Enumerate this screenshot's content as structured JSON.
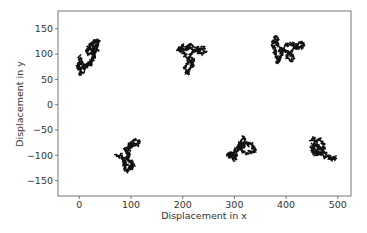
{
  "chart_data": {
    "type": "line",
    "title": "",
    "xlabel": "Displacement in x",
    "ylabel": "Displacement in y",
    "xlim": [
      -40,
      525
    ],
    "ylim": [
      -180,
      185
    ],
    "xticks": [
      0,
      100,
      200,
      300,
      400,
      500
    ],
    "yticks": [
      -150,
      -100,
      -50,
      0,
      50,
      100,
      150
    ],
    "grid": false,
    "legend": null,
    "line_color": "#111111",
    "series": [
      {
        "name": "walk-1",
        "center": [
          18,
          95
        ],
        "extent_x": [
          -5,
          40
        ],
        "extent_y": [
          57,
          130
        ],
        "path": [
          [
            0,
            80
          ],
          [
            -4,
            75
          ],
          [
            2,
            68
          ],
          [
            0,
            60
          ],
          [
            6,
            64
          ],
          [
            10,
            72
          ],
          [
            4,
            82
          ],
          [
            -2,
            78
          ],
          [
            3,
            86
          ],
          [
            8,
            80
          ],
          [
            14,
            76
          ],
          [
            18,
            82
          ],
          [
            22,
            78
          ],
          [
            20,
            86
          ],
          [
            26,
            92
          ],
          [
            30,
            98
          ],
          [
            24,
            104
          ],
          [
            18,
            100
          ],
          [
            14,
            108
          ],
          [
            20,
            114
          ],
          [
            28,
            110
          ],
          [
            24,
            118
          ],
          [
            30,
            124
          ],
          [
            36,
            128
          ],
          [
            38,
            120
          ],
          [
            32,
            114
          ],
          [
            36,
            108
          ],
          [
            30,
            104
          ],
          [
            26,
            112
          ],
          [
            34,
            118
          ],
          [
            28,
            126
          ],
          [
            22,
            120
          ],
          [
            16,
            114
          ],
          [
            24,
            106
          ],
          [
            30,
            96
          ],
          [
            26,
            90
          ],
          [
            20,
            84
          ],
          [
            12,
            78
          ],
          [
            6,
            74
          ],
          [
            0,
            70
          ],
          [
            -4,
            78
          ],
          [
            2,
            90
          ],
          [
            0,
            96
          ]
        ]
      },
      {
        "name": "walk-2",
        "center": [
          215,
          95
        ],
        "extent_x": [
          190,
          245
        ],
        "extent_y": [
          60,
          122
        ],
        "path": [
          [
            190,
            110
          ],
          [
            196,
            106
          ],
          [
            200,
            112
          ],
          [
            206,
            108
          ],
          [
            212,
            116
          ],
          [
            216,
            110
          ],
          [
            222,
            106
          ],
          [
            228,
            112
          ],
          [
            234,
            108
          ],
          [
            240,
            114
          ],
          [
            244,
            106
          ],
          [
            238,
            100
          ],
          [
            232,
            104
          ],
          [
            226,
            108
          ],
          [
            218,
            102
          ],
          [
            214,
            96
          ],
          [
            220,
            90
          ],
          [
            218,
            82
          ],
          [
            212,
            86
          ],
          [
            208,
            80
          ],
          [
            204,
            72
          ],
          [
            206,
            64
          ],
          [
            210,
            60
          ],
          [
            212,
            68
          ],
          [
            216,
            74
          ],
          [
            220,
            80
          ],
          [
            214,
            88
          ],
          [
            208,
            94
          ],
          [
            204,
            100
          ],
          [
            198,
            104
          ],
          [
            194,
            112
          ],
          [
            200,
            118
          ],
          [
            208,
            114
          ],
          [
            216,
            120
          ],
          [
            222,
            114
          ]
        ]
      },
      {
        "name": "walk-3",
        "center": [
          395,
          110
        ],
        "extent_x": [
          370,
          435
        ],
        "extent_y": [
          82,
          135
        ],
        "path": [
          [
            372,
            120
          ],
          [
            376,
            128
          ],
          [
            380,
            134
          ],
          [
            384,
            126
          ],
          [
            378,
            118
          ],
          [
            374,
            110
          ],
          [
            378,
            102
          ],
          [
            382,
            94
          ],
          [
            386,
            88
          ],
          [
            382,
            84
          ],
          [
            388,
            92
          ],
          [
            392,
            100
          ],
          [
            388,
            108
          ],
          [
            394,
            114
          ],
          [
            400,
            120
          ],
          [
            406,
            118
          ],
          [
            412,
            122
          ],
          [
            418,
            116
          ],
          [
            424,
            120
          ],
          [
            430,
            124
          ],
          [
            434,
            116
          ],
          [
            428,
            112
          ],
          [
            420,
            114
          ],
          [
            412,
            108
          ],
          [
            406,
            100
          ],
          [
            400,
            96
          ],
          [
            404,
            90
          ],
          [
            410,
            86
          ],
          [
            414,
            92
          ],
          [
            410,
            98
          ],
          [
            404,
            104
          ],
          [
            396,
            106
          ],
          [
            390,
            112
          ],
          [
            384,
            118
          ],
          [
            378,
            124
          ],
          [
            374,
            116
          ],
          [
            380,
            108
          ]
        ]
      },
      {
        "name": "walk-4",
        "center": [
          95,
          -110
        ],
        "extent_x": [
          70,
          118
        ],
        "extent_y": [
          -132,
          -68
        ],
        "path": [
          [
            70,
            -100
          ],
          [
            76,
            -104
          ],
          [
            80,
            -98
          ],
          [
            84,
            -106
          ],
          [
            88,
            -112
          ],
          [
            86,
            -120
          ],
          [
            90,
            -128
          ],
          [
            94,
            -132
          ],
          [
            98,
            -124
          ],
          [
            104,
            -120
          ],
          [
            100,
            -114
          ],
          [
            94,
            -108
          ],
          [
            98,
            -100
          ],
          [
            92,
            -94
          ],
          [
            88,
            -88
          ],
          [
            94,
            -84
          ],
          [
            98,
            -78
          ],
          [
            104,
            -74
          ],
          [
            110,
            -70
          ],
          [
            116,
            -74
          ],
          [
            112,
            -80
          ],
          [
            106,
            -78
          ],
          [
            100,
            -84
          ],
          [
            96,
            -92
          ],
          [
            92,
            -100
          ],
          [
            86,
            -110
          ],
          [
            92,
            -118
          ],
          [
            100,
            -126
          ],
          [
            106,
            -118
          ],
          [
            98,
            -112
          ],
          [
            90,
            -104
          ]
        ]
      },
      {
        "name": "walk-5",
        "center": [
          315,
          -88
        ],
        "extent_x": [
          285,
          345
        ],
        "extent_y": [
          -110,
          -63
        ],
        "path": [
          [
            286,
            -96
          ],
          [
            290,
            -100
          ],
          [
            294,
            -94
          ],
          [
            298,
            -104
          ],
          [
            300,
            -110
          ],
          [
            304,
            -102
          ],
          [
            300,
            -96
          ],
          [
            306,
            -90
          ],
          [
            310,
            -84
          ],
          [
            308,
            -76
          ],
          [
            314,
            -70
          ],
          [
            318,
            -64
          ],
          [
            322,
            -72
          ],
          [
            326,
            -80
          ],
          [
            332,
            -76
          ],
          [
            336,
            -84
          ],
          [
            340,
            -90
          ],
          [
            334,
            -96
          ],
          [
            328,
            -92
          ],
          [
            322,
            -98
          ],
          [
            316,
            -92
          ],
          [
            312,
            -86
          ],
          [
            318,
            -80
          ],
          [
            314,
            -74
          ],
          [
            308,
            -82
          ],
          [
            302,
            -90
          ],
          [
            296,
            -98
          ],
          [
            292,
            -104
          ],
          [
            288,
            -98
          ]
        ]
      },
      {
        "name": "walk-6",
        "center": [
          462,
          -88
        ],
        "extent_x": [
          445,
          498
        ],
        "extent_y": [
          -105,
          -63
        ],
        "path": [
          [
            448,
            -70
          ],
          [
            454,
            -66
          ],
          [
            460,
            -72
          ],
          [
            466,
            -68
          ],
          [
            470,
            -76
          ],
          [
            474,
            -82
          ],
          [
            470,
            -90
          ],
          [
            466,
            -96
          ],
          [
            460,
            -100
          ],
          [
            454,
            -96
          ],
          [
            450,
            -90
          ],
          [
            456,
            -84
          ],
          [
            462,
            -80
          ],
          [
            458,
            -74
          ],
          [
            452,
            -78
          ],
          [
            448,
            -86
          ],
          [
            454,
            -92
          ],
          [
            462,
            -94
          ],
          [
            470,
            -100
          ],
          [
            476,
            -104
          ],
          [
            482,
            -100
          ],
          [
            488,
            -106
          ],
          [
            494,
            -104
          ],
          [
            496,
            -108
          ],
          [
            490,
            -110
          ],
          [
            484,
            -104
          ],
          [
            478,
            -98
          ],
          [
            472,
            -90
          ],
          [
            466,
            -84
          ],
          [
            460,
            -88
          ]
        ]
      }
    ]
  },
  "axes": {
    "xlabel": "Displacement in x",
    "ylabel": "Displacement in y",
    "xtick_labels": [
      "0",
      "100",
      "200",
      "300",
      "400",
      "500"
    ],
    "ytick_labels": [
      "150",
      "100",
      "50",
      "0",
      "−50",
      "−100",
      "−150"
    ]
  }
}
